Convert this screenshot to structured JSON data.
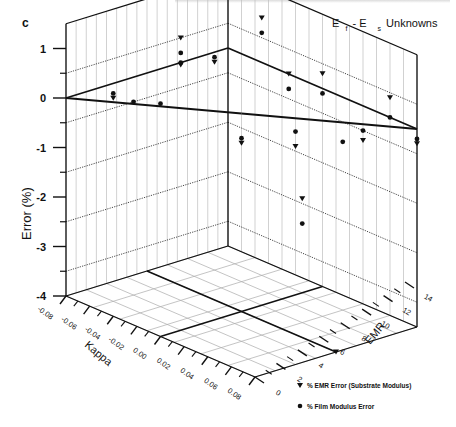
{
  "chart_data": {
    "type": "scatter",
    "panel_label": "c",
    "title": {
      "parts": [
        "E",
        "f",
        " - E",
        "s",
        " Unknowns"
      ],
      "text": "Ef - Es Unknowns"
    },
    "zlabel": "Error (%)",
    "xlabel": "Kappa",
    "ylabel": "EMR",
    "zlim": [
      -4,
      1.5
    ],
    "xlim": [
      -0.08,
      0.08
    ],
    "ylim": [
      0,
      14
    ],
    "z_ticks": [
      "1",
      "0",
      "-1",
      "-2",
      "-3",
      "-4"
    ],
    "z_tick_values": [
      1,
      0,
      -1,
      -2,
      -3,
      -4
    ],
    "x_ticks": [
      "-0.08",
      "-0.06",
      "-0.04",
      "-0.02",
      "0.00",
      "0.02",
      "0.04",
      "0.06",
      "0.08"
    ],
    "x_tick_values": [
      -0.08,
      -0.06,
      -0.04,
      -0.02,
      0.0,
      0.02,
      0.04,
      0.06,
      0.08
    ],
    "y_ticks": [
      "0",
      "2",
      "4",
      "6",
      "8",
      "10",
      "12",
      "14"
    ],
    "y_tick_values": [
      0,
      2,
      4,
      6,
      8,
      10,
      12,
      14
    ],
    "grid": true,
    "legend_position": "bottom-right",
    "series": [
      {
        "name": "% EMR Error (Substrate Modulus)",
        "marker": "triangle-down",
        "points": [
          {
            "kappa": -0.06,
            "emr": 12,
            "error": 0.1
          },
          {
            "kappa": -0.02,
            "emr": 10,
            "error": 1.3
          },
          {
            "kappa": 0.0,
            "emr": 7,
            "error": -0.6
          },
          {
            "kappa": 0.02,
            "emr": 13,
            "error": 0.15
          },
          {
            "kappa": 0.04,
            "emr": 12,
            "error": 0.2
          },
          {
            "kappa": 0.06,
            "emr": 10,
            "error": 1.2
          },
          {
            "kappa": 0.06,
            "emr": 8,
            "error": 0.3
          },
          {
            "kappa": 0.04,
            "emr": 6,
            "error": -0.8
          },
          {
            "kappa": 0.08,
            "emr": 7,
            "error": 0.3
          },
          {
            "kappa": 0.08,
            "emr": 4,
            "error": -0.7
          },
          {
            "kappa": 0.08,
            "emr": 2,
            "error": 0.4
          },
          {
            "kappa": 0.02,
            "emr": 4,
            "error": -1.5
          },
          {
            "kappa": 0.08,
            "emr": 0,
            "error": -0.3
          },
          {
            "kappa": 0.0,
            "emr": 0,
            "error": -4.0
          }
        ]
      },
      {
        "name": "% Film Modulus Error",
        "marker": "circle",
        "points": [
          {
            "kappa": -0.06,
            "emr": 12,
            "error": 0.2
          },
          {
            "kappa": -0.04,
            "emr": 12,
            "error": -0.1
          },
          {
            "kappa": -0.04,
            "emr": 10,
            "error": 0.1
          },
          {
            "kappa": -0.02,
            "emr": 10,
            "error": 1.0
          },
          {
            "kappa": 0.0,
            "emr": 7,
            "error": -0.5
          },
          {
            "kappa": 0.02,
            "emr": 13,
            "error": 0.2
          },
          {
            "kappa": 0.04,
            "emr": 12,
            "error": 0.3
          },
          {
            "kappa": 0.06,
            "emr": 10,
            "error": 0.9
          },
          {
            "kappa": 0.06,
            "emr": 8,
            "error": 0.0
          },
          {
            "kappa": 0.04,
            "emr": 6,
            "error": -0.5
          },
          {
            "kappa": 0.08,
            "emr": 7,
            "error": -0.1
          },
          {
            "kappa": 0.06,
            "emr": 4,
            "error": -0.6
          },
          {
            "kappa": 0.08,
            "emr": 2,
            "error": 0.0
          },
          {
            "kappa": 0.08,
            "emr": 4,
            "error": -0.5
          },
          {
            "kappa": 0.08,
            "emr": 0,
            "error": -0.2
          },
          {
            "kappa": 0.02,
            "emr": 4,
            "error": -2.0
          }
        ]
      }
    ],
    "reference_plane": {
      "error": 0
    }
  }
}
